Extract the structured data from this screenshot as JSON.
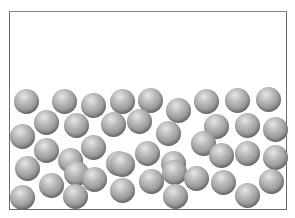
{
  "diagram": {
    "type": "particle-container",
    "sphere_color": "#9a9a9a",
    "border_color": "#6b6b6b",
    "sphere_diameter": 25,
    "spheres": [
      [
        26,
        101
      ],
      [
        64,
        101
      ],
      [
        93,
        105
      ],
      [
        122,
        101
      ],
      [
        150,
        100
      ],
      [
        178,
        110
      ],
      [
        206,
        101
      ],
      [
        237,
        100
      ],
      [
        268,
        99
      ],
      [
        46,
        122
      ],
      [
        76,
        125
      ],
      [
        113,
        124
      ],
      [
        139,
        121
      ],
      [
        168,
        133
      ],
      [
        216,
        126
      ],
      [
        247,
        125
      ],
      [
        275,
        129
      ],
      [
        22,
        136
      ],
      [
        46,
        150
      ],
      [
        70,
        160
      ],
      [
        93,
        147
      ],
      [
        118,
        163
      ],
      [
        147,
        153
      ],
      [
        173,
        163
      ],
      [
        203,
        143
      ],
      [
        221,
        155
      ],
      [
        247,
        153
      ],
      [
        275,
        157
      ],
      [
        27,
        168
      ],
      [
        51,
        185
      ],
      [
        76,
        173
      ],
      [
        94,
        179
      ],
      [
        122,
        164
      ],
      [
        151,
        181
      ],
      [
        174,
        172
      ],
      [
        196,
        178
      ],
      [
        223,
        182
      ],
      [
        271,
        181
      ],
      [
        22,
        197
      ],
      [
        75,
        196
      ],
      [
        122,
        190
      ],
      [
        175,
        196
      ],
      [
        247,
        195
      ]
    ]
  }
}
